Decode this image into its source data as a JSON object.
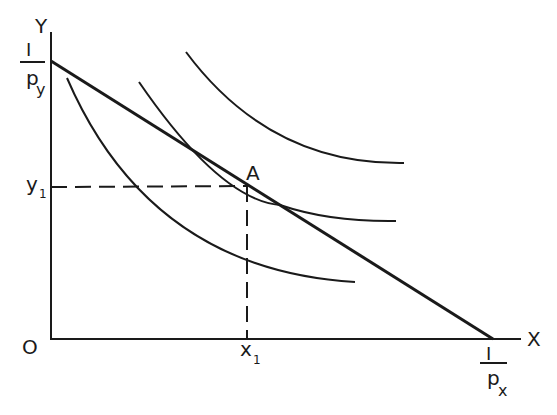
{
  "diagram": {
    "type": "consumer-equilibrium-indifference-curves",
    "axes": {
      "y_label": "Y",
      "x_label": "X",
      "origin_label": "O"
    },
    "intercepts": {
      "y_intercept": {
        "numerator": "I",
        "denominator": "p",
        "subscript": "y"
      },
      "x_intercept": {
        "numerator": "I",
        "denominator": "p",
        "subscript": "x"
      }
    },
    "equilibrium": {
      "point_label": "A",
      "y_value_label": "y",
      "y_value_subscript": "1",
      "x_value_label": "x",
      "x_value_subscript": "1"
    },
    "indifference_curves": [
      {
        "name": "lower",
        "position": "below budget line"
      },
      {
        "name": "tangent",
        "position": "tangent at A"
      },
      {
        "name": "higher",
        "position": "above budget line"
      }
    ],
    "colors": {
      "ink": "#1a1a1a",
      "background": "#ffffff"
    }
  }
}
